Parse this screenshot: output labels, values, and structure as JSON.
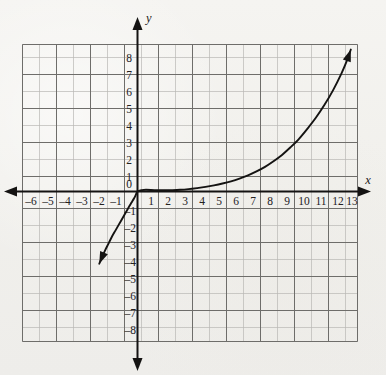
{
  "figure": {
    "kind": "coordinate-grid-graph",
    "background_color": "#f3f2ef",
    "ink_color": "#141312",
    "grid_minor_color": "#b9b8b4",
    "grid_major_color": "#6e6d6a"
  },
  "axes": {
    "x_axis_label": "x",
    "y_axis_label": "y",
    "origin_label": "0",
    "x_tick_labels": [
      "–6",
      "–5",
      "–4",
      "–3",
      "–2",
      "–1",
      "1",
      "2",
      "3",
      "4",
      "5",
      "6",
      "7",
      "8",
      "9",
      "10",
      "11",
      "12",
      "13"
    ],
    "y_tick_labels_positive": [
      "8",
      "7",
      "6",
      "5",
      "4",
      "3",
      "2",
      "1"
    ],
    "y_tick_labels_negative": [
      "–1",
      "–2",
      "–3",
      "–4",
      "–5",
      "–6",
      "–7",
      "–8"
    ],
    "x_arrow_left": true,
    "x_arrow_right": true,
    "y_arrow_up": true,
    "y_arrow_down": true
  },
  "chart_data": {
    "type": "line",
    "title": "",
    "xlabel": "x",
    "ylabel": "y",
    "xlim": [
      -6.5,
      13.5
    ],
    "ylim": [
      -8.5,
      8.5
    ],
    "grid": true,
    "grid_step": 1,
    "legend": "none",
    "series": [
      {
        "name": "curve",
        "description": "cube-root-like S curve passing through the origin; arrowheads on both ends",
        "x": [
          -2.25,
          -2.1,
          -1.9,
          -1.7,
          -1.5,
          -1.3,
          -1.1,
          -0.9,
          -0.7,
          -0.5,
          -0.35,
          -0.2,
          -0.1,
          0,
          0.25,
          0.5,
          1,
          1.5,
          2,
          2.5,
          3,
          3.5,
          4,
          4.5,
          5,
          5.5,
          6,
          6.5,
          7,
          7.5,
          8,
          8.5,
          9,
          9.5,
          10,
          10.5,
          11,
          11.5,
          12,
          12.3,
          12.55
        ],
        "y": [
          -4.25,
          -3.9,
          -3.45,
          -3.05,
          -2.65,
          -2.3,
          -1.95,
          -1.6,
          -1.25,
          -0.9,
          -0.65,
          -0.4,
          -0.2,
          0,
          0.08,
          0.1,
          0.08,
          0.07,
          0.08,
          0.1,
          0.14,
          0.2,
          0.27,
          0.36,
          0.47,
          0.6,
          0.76,
          0.95,
          1.18,
          1.45,
          1.78,
          2.15,
          2.6,
          3.1,
          3.7,
          4.35,
          5.1,
          5.95,
          6.95,
          7.65,
          8.35
        ],
        "arrow_start": {
          "x": -2.25,
          "y": -4.25,
          "direction": "down-left"
        },
        "arrow_end": {
          "x": 12.55,
          "y": 8.35,
          "direction": "up"
        }
      }
    ]
  }
}
